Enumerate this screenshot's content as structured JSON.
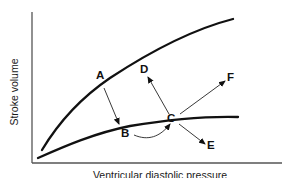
{
  "diagram": {
    "title": "",
    "axes": {
      "y_label": "Stroke volume",
      "x_label": "Ventricular diastolic pressure"
    },
    "curves": [
      {
        "name": "upper-curve",
        "description": "Higher contractility Frank-Starling curve"
      },
      {
        "name": "lower-curve",
        "description": "Lower contractility Frank-Starling curve"
      }
    ],
    "points": {
      "A": "A",
      "B": "B",
      "C": "C",
      "D": "D",
      "E": "E",
      "F": "F"
    },
    "arrows": [
      {
        "from": "A",
        "to": "B"
      },
      {
        "from": "B",
        "to": "C",
        "style": "curved"
      },
      {
        "from": "C",
        "to": "D"
      },
      {
        "from": "C",
        "to": "E"
      },
      {
        "from": "C",
        "to": "F"
      }
    ],
    "colors": {
      "line": "#111111",
      "axis": "#555555",
      "background": "#ffffff"
    }
  }
}
